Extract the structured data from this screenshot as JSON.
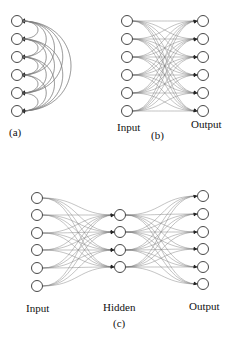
{
  "panels": {
    "a": {
      "caption": "(a)",
      "nodes_x": 17,
      "nodes_y": [
        21,
        39,
        57,
        75,
        93,
        111
      ],
      "description": "Fully recurrent single layer: each node connects to every other node via curved edges"
    },
    "b": {
      "caption": "(b)",
      "input_label": "Input",
      "output_label": "Output",
      "input_x": 127,
      "output_x": 203,
      "nodes_y": [
        21,
        39,
        57,
        75,
        93,
        111
      ],
      "description": "Two-layer fully connected network, 6 inputs to 6 outputs"
    },
    "c": {
      "caption": "(c)",
      "input_label": "Input",
      "hidden_label": "Hidden",
      "output_label": "Output",
      "input_x": 37,
      "hidden_x": 120,
      "output_x": 203,
      "input_y": [
        198,
        215,
        233,
        250,
        268,
        286
      ],
      "hidden_y": [
        215,
        232,
        250,
        267
      ],
      "output_y": [
        196,
        214,
        232,
        249,
        267,
        284
      ],
      "description": "Three-layer network: 6 input, 4 hidden, 6 output nodes, fully connected between layers"
    }
  },
  "style": {
    "node_radius": 5.5,
    "edge_color": "#7a7a7a",
    "node_stroke": "#333333"
  }
}
